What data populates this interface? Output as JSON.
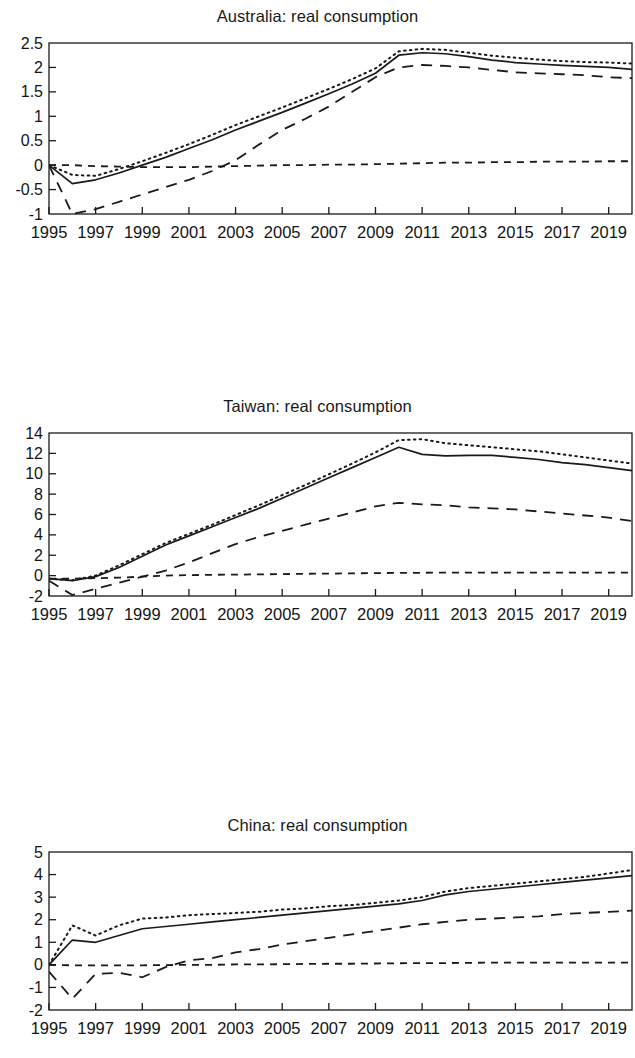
{
  "page": {
    "background": "#ffffff",
    "ink": "#1a1a1a"
  },
  "charts": [
    {
      "id": "australia",
      "title": "Australia: real consumption"
    },
    {
      "id": "taiwan",
      "title": "Taiwan: real consumption"
    },
    {
      "id": "china",
      "title": "China: real consumption"
    }
  ],
  "chart_data": [
    {
      "type": "line",
      "title": "Australia: real consumption",
      "xlabel": "",
      "ylabel": "",
      "xlim": [
        1995,
        2020
      ],
      "ylim": [
        -1,
        2.5
      ],
      "yticks": [
        -1,
        -0.5,
        0,
        0.5,
        1,
        1.5,
        2,
        2.5
      ],
      "ytick_labels": [
        "-1",
        "-0.5",
        "0",
        "0.5",
        "1",
        "1.5",
        "2",
        "2.5"
      ],
      "xticks": [
        1995,
        1997,
        1999,
        2001,
        2003,
        2005,
        2007,
        2009,
        2011,
        2013,
        2015,
        2017,
        2019
      ],
      "xtick_labels": [
        "1995",
        "1997",
        "1999",
        "2001",
        "2003",
        "2005",
        "2007",
        "2009",
        "2011",
        "2013",
        "2015",
        "2017",
        "2019"
      ],
      "grid": false,
      "legend": "none",
      "x": [
        1995,
        1996,
        1997,
        1998,
        1999,
        2000,
        2001,
        2002,
        2003,
        2004,
        2005,
        2006,
        2007,
        2008,
        2009,
        2010,
        2011,
        2012,
        2013,
        2014,
        2015,
        2016,
        2017,
        2018,
        2019,
        2020
      ],
      "series": [
        {
          "name": "solid",
          "style": "solid",
          "values": [
            0.0,
            -0.38,
            -0.3,
            -0.16,
            0.0,
            0.16,
            0.34,
            0.52,
            0.72,
            0.9,
            1.08,
            1.27,
            1.46,
            1.66,
            1.88,
            2.25,
            2.3,
            2.28,
            2.22,
            2.15,
            2.1,
            2.07,
            2.04,
            2.02,
            2.0,
            1.96
          ]
        },
        {
          "name": "dotted",
          "style": "dotted",
          "values": [
            0.0,
            -0.2,
            -0.22,
            -0.08,
            0.08,
            0.25,
            0.43,
            0.62,
            0.82,
            1.0,
            1.18,
            1.37,
            1.56,
            1.76,
            1.98,
            2.33,
            2.38,
            2.36,
            2.3,
            2.24,
            2.2,
            2.16,
            2.13,
            2.11,
            2.1,
            2.08
          ]
        },
        {
          "name": "long-dash",
          "style": "long-dash",
          "values": [
            0.0,
            -1.0,
            -0.9,
            -0.75,
            -0.6,
            -0.45,
            -0.3,
            -0.12,
            0.1,
            0.42,
            0.72,
            0.95,
            1.2,
            1.5,
            1.8,
            2.0,
            2.05,
            2.03,
            2.0,
            1.95,
            1.9,
            1.88,
            1.86,
            1.84,
            1.8,
            1.78
          ]
        },
        {
          "name": "short-dash",
          "style": "short-dash",
          "values": [
            0.0,
            0.0,
            -0.02,
            -0.03,
            -0.04,
            -0.04,
            -0.04,
            -0.03,
            -0.02,
            -0.01,
            0.0,
            0.0,
            0.01,
            0.01,
            0.02,
            0.03,
            0.04,
            0.05,
            0.05,
            0.06,
            0.06,
            0.07,
            0.07,
            0.07,
            0.08,
            0.08
          ]
        }
      ]
    },
    {
      "type": "line",
      "title": "Taiwan: real consumption",
      "xlabel": "",
      "ylabel": "",
      "xlim": [
        1995,
        2020
      ],
      "ylim": [
        -2,
        14
      ],
      "yticks": [
        -2,
        0,
        2,
        4,
        6,
        8,
        10,
        12,
        14
      ],
      "ytick_labels": [
        "-2",
        "0",
        "2",
        "4",
        "6",
        "8",
        "10",
        "12",
        "14"
      ],
      "xticks": [
        1995,
        1997,
        1999,
        2001,
        2003,
        2005,
        2007,
        2009,
        2011,
        2013,
        2015,
        2017,
        2019
      ],
      "xtick_labels": [
        "1995",
        "1997",
        "1999",
        "2001",
        "2003",
        "2005",
        "2007",
        "2009",
        "2011",
        "2013",
        "2015",
        "2017",
        "2019"
      ],
      "grid": false,
      "legend": "none",
      "x": [
        1995,
        1996,
        1997,
        1998,
        1999,
        2000,
        2001,
        2002,
        2003,
        2004,
        2005,
        2006,
        2007,
        2008,
        2009,
        2010,
        2011,
        2012,
        2013,
        2014,
        2015,
        2016,
        2017,
        2018,
        2019,
        2020
      ],
      "series": [
        {
          "name": "solid",
          "style": "solid",
          "values": [
            -0.3,
            -0.5,
            -0.1,
            0.8,
            1.9,
            3.0,
            3.9,
            4.8,
            5.7,
            6.6,
            7.6,
            8.6,
            9.6,
            10.6,
            11.6,
            12.6,
            11.9,
            11.75,
            11.8,
            11.8,
            11.6,
            11.4,
            11.1,
            10.9,
            10.6,
            10.3
          ]
        },
        {
          "name": "dotted",
          "style": "dotted",
          "values": [
            -0.3,
            -0.45,
            0.0,
            1.0,
            2.1,
            3.2,
            4.1,
            5.0,
            5.95,
            6.9,
            7.9,
            8.9,
            9.95,
            11.0,
            12.1,
            13.3,
            13.4,
            13.0,
            12.8,
            12.6,
            12.4,
            12.2,
            11.9,
            11.6,
            11.3,
            11.0
          ]
        },
        {
          "name": "long-dash",
          "style": "long-dash",
          "values": [
            -0.5,
            -1.9,
            -1.3,
            -0.7,
            -0.1,
            0.5,
            1.3,
            2.2,
            3.1,
            3.8,
            4.4,
            5.0,
            5.6,
            6.2,
            6.8,
            7.15,
            7.0,
            6.9,
            6.7,
            6.6,
            6.5,
            6.3,
            6.1,
            5.9,
            5.7,
            5.35
          ]
        },
        {
          "name": "short-dash",
          "style": "short-dash",
          "values": [
            -0.3,
            -0.3,
            -0.25,
            -0.2,
            -0.1,
            0.0,
            0.05,
            0.08,
            0.1,
            0.12,
            0.15,
            0.18,
            0.2,
            0.22,
            0.25,
            0.27,
            0.28,
            0.3,
            0.3,
            0.3,
            0.3,
            0.3,
            0.3,
            0.3,
            0.3,
            0.3
          ]
        }
      ]
    },
    {
      "type": "line",
      "title": "China: real consumption",
      "xlabel": "",
      "ylabel": "",
      "xlim": [
        1995,
        2020
      ],
      "ylim": [
        -2,
        5
      ],
      "yticks": [
        -2,
        -1,
        0,
        1,
        2,
        3,
        4,
        5
      ],
      "ytick_labels": [
        "-2",
        "-1",
        "0",
        "1",
        "2",
        "3",
        "4",
        "5"
      ],
      "xticks": [
        1995,
        1997,
        1999,
        2001,
        2003,
        2005,
        2007,
        2009,
        2011,
        2013,
        2015,
        2017,
        2019
      ],
      "xtick_labels": [
        "1995",
        "1997",
        "1999",
        "2001",
        "2003",
        "2005",
        "2007",
        "2009",
        "2011",
        "2013",
        "2015",
        "2017",
        "2019"
      ],
      "grid": false,
      "legend": "none",
      "x": [
        1995,
        1996,
        1997,
        1998,
        1999,
        2000,
        2001,
        2002,
        2003,
        2004,
        2005,
        2006,
        2007,
        2008,
        2009,
        2010,
        2011,
        2012,
        2013,
        2014,
        2015,
        2016,
        2017,
        2018,
        2019,
        2020
      ],
      "series": [
        {
          "name": "solid",
          "style": "solid",
          "values": [
            0.0,
            1.1,
            1.0,
            1.3,
            1.6,
            1.7,
            1.8,
            1.9,
            2.0,
            2.1,
            2.2,
            2.3,
            2.4,
            2.5,
            2.6,
            2.7,
            2.85,
            3.1,
            3.25,
            3.35,
            3.45,
            3.55,
            3.65,
            3.75,
            3.85,
            3.95
          ]
        },
        {
          "name": "dotted",
          "style": "dotted",
          "values": [
            0.0,
            1.75,
            1.3,
            1.75,
            2.05,
            2.1,
            2.2,
            2.25,
            2.3,
            2.35,
            2.45,
            2.5,
            2.6,
            2.65,
            2.75,
            2.85,
            3.0,
            3.25,
            3.4,
            3.5,
            3.6,
            3.7,
            3.8,
            3.9,
            4.05,
            4.2
          ]
        },
        {
          "name": "long-dash",
          "style": "long-dash",
          "values": [
            -0.3,
            -1.5,
            -0.4,
            -0.35,
            -0.55,
            -0.1,
            0.2,
            0.3,
            0.55,
            0.7,
            0.9,
            1.05,
            1.2,
            1.35,
            1.5,
            1.65,
            1.8,
            1.9,
            2.0,
            2.05,
            2.1,
            2.15,
            2.25,
            2.3,
            2.35,
            2.4
          ]
        },
        {
          "name": "short-dash",
          "style": "short-dash",
          "values": [
            0.0,
            -0.02,
            -0.02,
            -0.02,
            -0.02,
            -0.01,
            0.0,
            0.0,
            0.02,
            0.02,
            0.03,
            0.04,
            0.05,
            0.05,
            0.06,
            0.07,
            0.08,
            0.08,
            0.09,
            0.1,
            0.1,
            0.1,
            0.1,
            0.1,
            0.1,
            0.1
          ]
        }
      ]
    }
  ]
}
